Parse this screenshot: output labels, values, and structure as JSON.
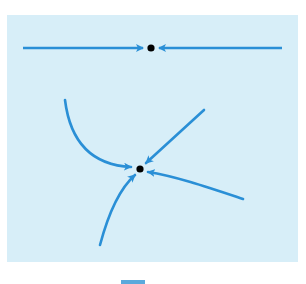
{
  "figure": {
    "colors": {
      "panel_background": "#d7eef8",
      "trajectory": "#2a8fd6",
      "equilibrium_point": "#000000",
      "footer_mark": "#5aa9dc"
    },
    "top_portrait": {
      "label": "1D stable equilibrium",
      "equilibrium": {
        "x": 151,
        "y": 48
      },
      "left_segment": {
        "from": [
          23,
          48
        ],
        "to": [
          143,
          48
        ],
        "direction": "toward-equilibrium"
      },
      "right_segment": {
        "from": [
          282,
          48
        ],
        "to": [
          159,
          48
        ],
        "direction": "toward-equilibrium"
      }
    },
    "bottom_portrait": {
      "label": "2D stable node",
      "equilibrium": {
        "x": 140,
        "y": 169
      },
      "trajectories": [
        {
          "name": "upper-left-curve",
          "path": "M65 100 C70 140 90 165 131 167",
          "arrow_at": [
            131,
            167
          ]
        },
        {
          "name": "upper-right-line",
          "path": "M204 110 L146 163",
          "arrow_at": [
            146,
            163
          ]
        },
        {
          "name": "right-curve",
          "path": "M243 199 C210 188 175 176 148 172",
          "arrow_at": [
            148,
            172
          ]
        },
        {
          "name": "lower-curve",
          "path": "M100 245 C108 215 118 190 135 175",
          "arrow_at": [
            135,
            175
          ]
        }
      ]
    }
  }
}
